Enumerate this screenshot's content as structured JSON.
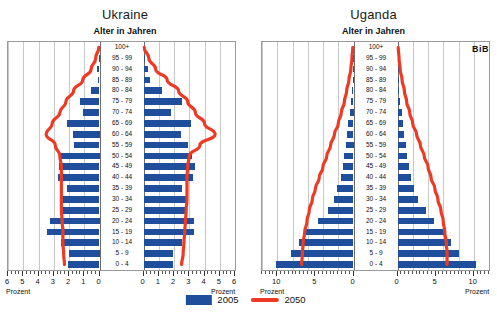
{
  "figure": {
    "axis_title": "Alter in Jahren",
    "unit_label": "Prozent",
    "source_logo": "BiB",
    "colors": {
      "bar_2005": "#1F4E9C",
      "line_2050": "#EE3A24",
      "grid": "#c9c9c9",
      "frame": "#9a9a9a"
    }
  },
  "legend": {
    "items": [
      {
        "label": "2005",
        "type": "bar",
        "color": "#1F4E9C"
      },
      {
        "label": "2050",
        "type": "line",
        "color": "#EE3A24"
      }
    ]
  },
  "age_groups": [
    "100+",
    "95 - 99",
    "90 - 94",
    "85 - 89",
    "80 - 84",
    "75 - 79",
    "70 - 74",
    "65 - 69",
    "60 - 64",
    "55 - 59",
    "50 - 54",
    "45 - 49",
    "40 - 44",
    "35 - 39",
    "30 - 34",
    "25 - 29",
    "20 - 24",
    "15 - 19",
    "10 - 14",
    "5 - 9",
    "0 - 4"
  ],
  "chart_data": [
    {
      "type": "bar",
      "id": "ukraine",
      "title": "Ukraine",
      "subtitle": "Alter in Jahren",
      "xlabel": "Prozent",
      "ylabel": "Alter in Jahren",
      "xlim": [
        0,
        6
      ],
      "xticks_left": [
        6,
        5,
        4,
        3,
        2,
        1,
        0
      ],
      "xticks_right": [
        0,
        1,
        2,
        3,
        4,
        5,
        6
      ],
      "grid": true,
      "legend_position": "bottom-center",
      "categories": [
        "100+",
        "95 - 99",
        "90 - 94",
        "85 - 89",
        "80 - 84",
        "75 - 79",
        "70 - 74",
        "65 - 69",
        "60 - 64",
        "55 - 59",
        "50 - 54",
        "45 - 49",
        "40 - 44",
        "35 - 39",
        "30 - 34",
        "25 - 29",
        "20 - 24",
        "15 - 19",
        "10 - 14",
        "5 - 9",
        "0 - 4"
      ],
      "series": [
        {
          "name": "2005",
          "side": "left",
          "kind": "bar",
          "values": [
            0.0,
            0.05,
            0.15,
            0.1,
            0.55,
            1.3,
            1.1,
            2.1,
            1.75,
            1.65,
            2.5,
            2.65,
            2.7,
            2.1,
            2.6,
            2.6,
            3.25,
            3.45,
            2.55,
            2.0,
            2.05
          ]
        },
        {
          "name": "2005",
          "side": "right",
          "kind": "bar",
          "values": [
            0.0,
            0.1,
            0.3,
            0.45,
            1.2,
            2.5,
            1.8,
            3.1,
            2.45,
            2.95,
            3.2,
            3.4,
            3.25,
            2.5,
            2.85,
            2.8,
            3.3,
            3.3,
            2.55,
            1.95,
            1.95
          ]
        },
        {
          "name": "2050",
          "side": "left",
          "kind": "line",
          "values": [
            0.05,
            0.25,
            0.55,
            1.1,
            1.7,
            2.2,
            2.6,
            3.1,
            3.5,
            2.9,
            2.6,
            2.5,
            2.5,
            2.5,
            2.5,
            2.5,
            2.45,
            2.4,
            2.4,
            2.35,
            2.3
          ]
        },
        {
          "name": "2050",
          "side": "right",
          "kind": "line",
          "values": [
            0.05,
            0.35,
            0.8,
            1.55,
            2.3,
            2.9,
            3.4,
            4.0,
            4.7,
            3.7,
            3.0,
            2.9,
            2.85,
            2.85,
            2.85,
            2.8,
            2.75,
            2.7,
            2.65,
            2.6,
            2.5
          ]
        }
      ]
    },
    {
      "type": "bar",
      "id": "uganda",
      "title": "Uganda",
      "subtitle": "Alter in Jahren",
      "xlabel": "Prozent",
      "ylabel": "Alter in Jahren",
      "xlim": [
        0,
        12
      ],
      "xticks_left": [
        10,
        5,
        0
      ],
      "xticks_right": [
        0,
        5,
        10
      ],
      "grid": true,
      "legend_position": "bottom-center",
      "categories": [
        "100+",
        "95 - 99",
        "90 - 94",
        "85 - 89",
        "80 - 84",
        "75 - 79",
        "70 - 74",
        "65 - 69",
        "60 - 64",
        "55 - 59",
        "50 - 54",
        "45 - 49",
        "40 - 44",
        "35 - 39",
        "30 - 34",
        "25 - 29",
        "20 - 24",
        "15 - 19",
        "10 - 14",
        "5 - 9",
        "0 - 4"
      ],
      "series": [
        {
          "name": "2005",
          "side": "left",
          "kind": "bar",
          "values": [
            0.0,
            0.02,
            0.05,
            0.1,
            0.2,
            0.35,
            0.5,
            0.7,
            0.85,
            1.0,
            1.2,
            1.4,
            1.7,
            2.1,
            2.6,
            3.4,
            4.6,
            6.3,
            7.2,
            8.2,
            10.1
          ]
        },
        {
          "name": "2005",
          "side": "right",
          "kind": "bar",
          "values": [
            0.0,
            0.02,
            0.05,
            0.12,
            0.22,
            0.38,
            0.55,
            0.75,
            0.9,
            1.05,
            1.25,
            1.45,
            1.75,
            2.1,
            2.7,
            3.7,
            4.8,
            6.2,
            7.0,
            8.0,
            10.3
          ]
        },
        {
          "name": "2050",
          "side": "left",
          "kind": "line",
          "values": [
            0.1,
            0.2,
            0.35,
            0.6,
            0.9,
            1.2,
            1.6,
            2.0,
            2.5,
            3.0,
            3.5,
            4.0,
            4.5,
            5.0,
            5.4,
            5.8,
            6.1,
            6.4,
            6.6,
            6.7,
            6.8
          ]
        },
        {
          "name": "2050",
          "side": "right",
          "kind": "line",
          "values": [
            0.1,
            0.2,
            0.35,
            0.6,
            0.9,
            1.2,
            1.6,
            2.0,
            2.5,
            3.0,
            3.5,
            4.0,
            4.4,
            4.9,
            5.3,
            5.7,
            6.0,
            6.2,
            6.4,
            6.5,
            6.5
          ]
        }
      ]
    }
  ]
}
